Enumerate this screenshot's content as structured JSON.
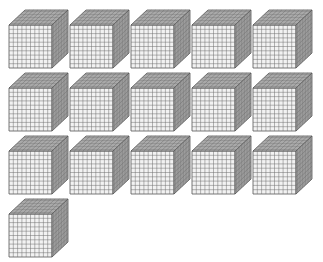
{
  "diagram": {
    "type": "base-ten-blocks",
    "block_kind": "thousand-cube",
    "grid_divisions": 10,
    "cube_count": 16,
    "rows": [
      {
        "count": 5
      },
      {
        "count": 5
      },
      {
        "count": 5
      },
      {
        "count": 1
      }
    ],
    "colors": {
      "front_face": "#f2f2f2",
      "top_face": "#bdbdbd",
      "side_face": "#a8a8a8",
      "grid_line": "#6e6e6e",
      "edge": "#555555"
    }
  }
}
